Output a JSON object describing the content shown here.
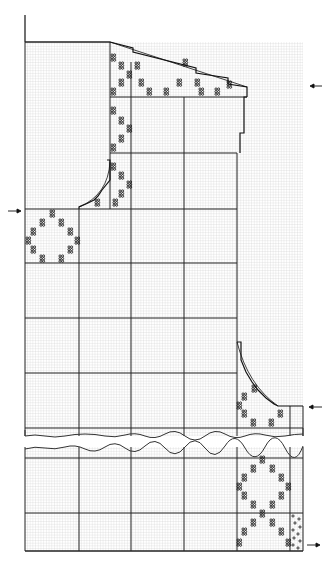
{
  "diagram": {
    "type": "knitting-chart",
    "colors": {
      "background": "#ffffff",
      "fine_grid": "#c8c8c8",
      "major_grid": "#222222",
      "outline": "#111111",
      "motif": "#111111"
    },
    "grid": {
      "left": 25,
      "right": 303,
      "top": 42,
      "bottom": 551,
      "cell": 2.7,
      "major_verticals": [
        25,
        79,
        131,
        184,
        237,
        290
      ],
      "major_horizontals": [
        97,
        153,
        209,
        263,
        318,
        373,
        428,
        458,
        513,
        551
      ]
    },
    "break": {
      "top": 436,
      "bottom": 447
    },
    "arrows": [
      {
        "name": "arrow-upper-right",
        "x": 318,
        "y": 86,
        "direction": "left"
      },
      {
        "name": "arrow-mid-left",
        "x": 12,
        "y": 211,
        "direction": "right"
      },
      {
        "name": "arrow-lower-right",
        "x": 318,
        "y": 407,
        "direction": "left"
      },
      {
        "name": "arrow-bottom-right",
        "x": 312,
        "y": 545,
        "direction": "right"
      }
    ],
    "motif_symbol": "four-dot cluster (88)"
  }
}
